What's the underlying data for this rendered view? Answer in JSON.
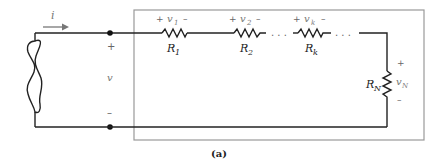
{
  "diagram": {
    "type": "series-resistor-circuit",
    "caption": "(a)",
    "current_label": "i",
    "source_voltage": {
      "plus": "+",
      "label": "v",
      "minus": "–"
    },
    "resistors": [
      {
        "name": "R",
        "sub": "1",
        "voltage": "v",
        "vsub": "1",
        "plus": "+",
        "minus": "–"
      },
      {
        "name": "R",
        "sub": "2",
        "voltage": "v",
        "vsub": "2",
        "plus": "+",
        "minus": "–"
      },
      {
        "name": "R",
        "sub": "k",
        "voltage": "v",
        "vsub": "k",
        "plus": "+",
        "minus": "–"
      },
      {
        "name": "R",
        "sub": "N",
        "voltage": "v",
        "vsub": "N",
        "plus": "+",
        "minus": "–"
      }
    ],
    "ellipsis": ". . ."
  },
  "colors": {
    "wire": "#222222",
    "box": "#999999",
    "label_gray": "#777777"
  }
}
